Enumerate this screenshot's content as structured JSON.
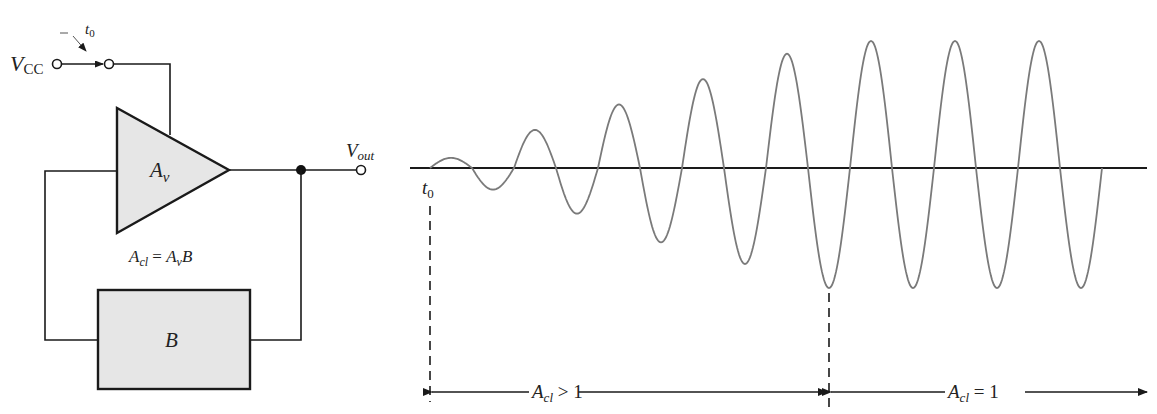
{
  "circuit": {
    "supply_label": "V",
    "supply_sub": "CC",
    "switch_time_label": "t",
    "switch_time_sub": "0",
    "amplifier_label": "A",
    "amplifier_sub": "v",
    "output_label": "V",
    "output_sub": "out",
    "gain_equation": {
      "lhs": "A",
      "lhs_sub": "cl",
      "eq": " = ",
      "rhs": "A",
      "rhs_sub": "v",
      "rhs_tail": "B"
    },
    "feedback_label": "B"
  },
  "waveform": {
    "start_label": "t",
    "start_sub": "0",
    "description": "Oscillation builds up from t0 while closed-loop gain > 1, then stabilizes at constant amplitude when closed-loop gain = 1",
    "relative_peak_amplitudes": [
      0.08,
      0.3,
      0.5,
      0.7,
      0.9,
      1.0,
      1.0,
      1.0
    ],
    "relative_trough_amplitudes": [
      0.18,
      0.38,
      0.62,
      0.8,
      1.0,
      1.0,
      1.0,
      1.0
    ],
    "region_growth": {
      "label": "A",
      "sub": "cl",
      "rel": " > 1"
    },
    "region_steady": {
      "label": "A",
      "sub": "cl",
      "rel": " = 1"
    }
  }
}
